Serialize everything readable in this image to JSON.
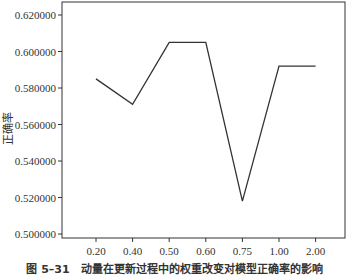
{
  "chart_data": {
    "type": "line",
    "title": "",
    "xlabel": "",
    "ylabel": "正确率",
    "categories": [
      "0.20",
      "0.40",
      "0.50",
      "0.60",
      "0.75",
      "1.00",
      "2.00"
    ],
    "series": [
      {
        "name": "正确率",
        "values": [
          0.585,
          0.571,
          0.605,
          0.605,
          0.518,
          0.592,
          0.592
        ],
        "color": "#333333"
      }
    ],
    "ylim": [
      0.4945,
      0.6275
    ],
    "yticks": [
      0.5,
      0.52,
      0.54,
      0.56,
      0.58,
      0.6,
      0.62
    ],
    "ytick_labels": [
      "0.500000",
      "0.520000",
      "0.540000",
      "0.560000",
      "0.580000",
      "0.600000",
      "0.620000"
    ],
    "grid": false,
    "legend": "none"
  },
  "caption": "图 5–31　动量在更新过程中的权重改变对模型正确率的影响",
  "colors": {
    "background": "#ffffff",
    "axis": "#333333",
    "line": "#333333",
    "text": "#333333"
  }
}
